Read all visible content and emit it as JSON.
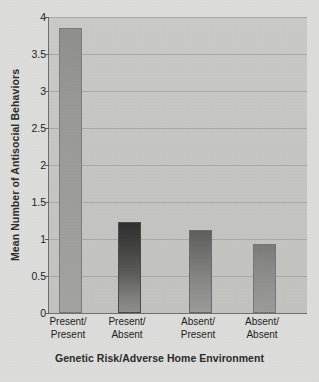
{
  "chart_data": {
    "type": "bar",
    "title": "",
    "xlabel": "Genetic Risk/Adverse Home Environment",
    "ylabel": "Mean Number of Antisocial Behaviors",
    "categories": [
      "Present/\nPresent",
      "Present/\nAbsent",
      "Absent/\nPresent",
      "Absent/\nAbsent"
    ],
    "category_lines": [
      [
        "Present/",
        "Present"
      ],
      [
        "Present/",
        "Absent"
      ],
      [
        "Absent/",
        "Present"
      ],
      [
        "Absent/",
        "Absent"
      ]
    ],
    "values": [
      3.83,
      1.2,
      1.1,
      0.9
    ],
    "ylim": [
      0,
      4
    ],
    "yticks": [
      0,
      0.5,
      1,
      1.5,
      2,
      2.5,
      3,
      3.5,
      4
    ],
    "ytick_labels": [
      "0",
      "0.5",
      "1",
      "1.5",
      "2",
      "2.5",
      "3",
      "3.5",
      "4"
    ],
    "grid": "horizontal",
    "legend": "none",
    "bar_styles": [
      "light",
      "dark",
      "mid",
      "midlight"
    ],
    "colors": {
      "plot_background": "#c5c5c2",
      "figure_background": "#dcdcda",
      "gridline": "#a9a9a6",
      "axis": "#6e6e6e",
      "bar_1": "#9a9a98",
      "bar_2": "#3d3d3d",
      "bar_3": "#6e6e6c",
      "bar_4": "#878785",
      "text": "#1d1d1d"
    }
  }
}
